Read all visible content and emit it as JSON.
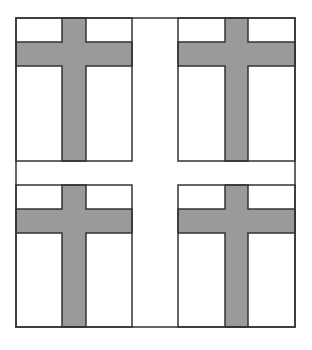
{
  "diagram": {
    "colors": {
      "background": "#ffffff",
      "stroke": "#333333",
      "cross_fill": "#9a9a9a"
    },
    "outer_frame": {
      "x": 16,
      "y": 18,
      "w": 279,
      "h": 309
    },
    "panels": [
      {
        "id": "top-left",
        "x": 16,
        "y": 18,
        "w": 116,
        "h": 143,
        "cross": {
          "vx": 62,
          "vw": 24,
          "hy": 42,
          "hh": 24
        }
      },
      {
        "id": "top-right",
        "x": 178,
        "y": 18,
        "w": 117,
        "h": 143,
        "cross": {
          "vx": 225,
          "vw": 23,
          "hy": 42,
          "hh": 24
        }
      },
      {
        "id": "bottom-left",
        "x": 16,
        "y": 185,
        "w": 116,
        "h": 142,
        "cross": {
          "vx": 62,
          "vw": 24,
          "hy": 209,
          "hh": 24
        }
      },
      {
        "id": "bottom-right",
        "x": 178,
        "y": 185,
        "w": 117,
        "h": 142,
        "cross": {
          "vx": 225,
          "vw": 23,
          "hy": 209,
          "hh": 24
        }
      }
    ]
  }
}
